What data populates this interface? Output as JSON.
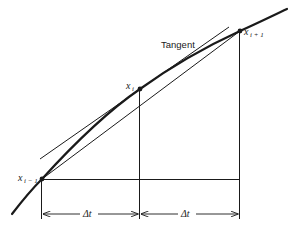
{
  "diagram": {
    "type": "numerical-derivative-geometry",
    "colors": {
      "ink": "#1a1a1a",
      "background": "#ffffff"
    },
    "labels": {
      "tangent": "Tangent",
      "point_prev_main": "x",
      "point_prev_sub": "i − 1",
      "point_mid_main": "x",
      "point_mid_sub": "i",
      "point_next_main": "x",
      "point_next_sub": "i + 1",
      "delta_left": "Δt",
      "delta_right": "Δt"
    },
    "points": [
      {
        "name": "x_{i-1}",
        "x": 42,
        "y": 179
      },
      {
        "name": "x_i",
        "x": 140,
        "y": 89
      },
      {
        "name": "x_{i+1}",
        "x": 240,
        "y": 31
      }
    ]
  }
}
